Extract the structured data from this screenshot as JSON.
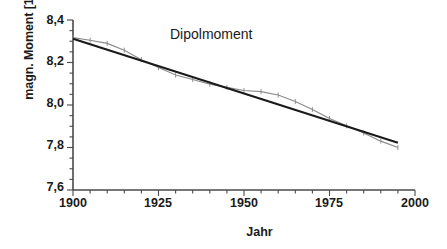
{
  "chart_data": {
    "type": "line",
    "title": "Dipolmoment",
    "xlabel": "Jahr",
    "ylabel": "magn. Moment [10^22 Am^2]",
    "ylabel_prefix": "magn. Moment [10",
    "ylabel_exponent": "22",
    "ylabel_mid": " Am",
    "ylabel_exponent2": "2",
    "ylabel_suffix": "]",
    "xlim": [
      1900,
      2000
    ],
    "ylim": [
      7.6,
      8.4
    ],
    "xticks": [
      1900,
      1925,
      1950,
      1975,
      2000
    ],
    "xtick_labels": [
      "1900",
      "1925",
      "1950",
      "1975",
      "2000"
    ],
    "yticks": [
      7.6,
      7.8,
      8.0,
      8.2,
      8.4
    ],
    "ytick_labels": [
      "7,6",
      "7,8",
      "8,0",
      "8,2",
      "8,4"
    ],
    "x_minor_step": 5,
    "y_minor_step": 0.05,
    "grid": false,
    "legend": "none",
    "series": [
      {
        "name": "Messdaten",
        "style": "line-with-errorbars",
        "color": "#8a8a8a",
        "x": [
          1900,
          1905,
          1910,
          1915,
          1920,
          1925,
          1930,
          1935,
          1940,
          1945,
          1950,
          1955,
          1960,
          1965,
          1970,
          1975,
          1980,
          1985,
          1990,
          1995
        ],
        "values": [
          8.317,
          8.305,
          8.29,
          8.258,
          8.213,
          8.176,
          8.141,
          8.12,
          8.098,
          8.083,
          8.068,
          8.063,
          8.047,
          8.016,
          7.979,
          7.936,
          7.902,
          7.868,
          7.83,
          7.8
        ],
        "yerr": [
          0.012,
          0.012,
          0.012,
          0.012,
          0.012,
          0.012,
          0.012,
          0.012,
          0.012,
          0.012,
          0.012,
          0.012,
          0.012,
          0.012,
          0.012,
          0.012,
          0.012,
          0.012,
          0.012,
          0.012
        ]
      },
      {
        "name": "Linearer Trend",
        "style": "straight-line",
        "color": "#1a1a1a",
        "x": [
          1900,
          1995
        ],
        "values": [
          8.312,
          7.822
        ]
      }
    ],
    "annotations": [
      {
        "text": "Dipolmoment",
        "x": 1945,
        "y": 8.34
      }
    ]
  },
  "axis_color": "#4a4a4a",
  "text_color": "#1a1a1a"
}
